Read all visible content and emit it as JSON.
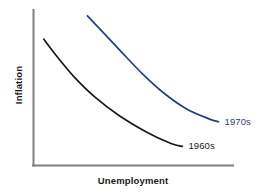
{
  "chart_data": {
    "type": "line",
    "title": "",
    "subtitle": "",
    "xlabel": "Unemployment",
    "ylabel": "Inflation",
    "grid": false,
    "legend_position": "inline-end-of-curve",
    "axis_style": "open-L-spine-no-ticks",
    "xticks": [],
    "yticks": [],
    "xlim": [
      0,
      1
    ],
    "ylim": [
      0,
      1
    ],
    "annotations": [
      {
        "text": "1970s",
        "color": "#2a3f82",
        "attached_to": "1970s"
      },
      {
        "text": "1960s",
        "color": "#1a1a1a",
        "attached_to": "1960s"
      }
    ],
    "series": [
      {
        "name": "1960s",
        "label": "1960s",
        "color": "#1a1a1a",
        "x": [
          0.03,
          0.1,
          0.19,
          0.3,
          0.43,
          0.57,
          0.7,
          0.76
        ],
        "y": [
          0.82,
          0.7,
          0.56,
          0.42,
          0.29,
          0.18,
          0.1,
          0.08
        ]
      },
      {
        "name": "1970s",
        "label": "1970s",
        "color": "#2a3f82",
        "x": [
          0.26,
          0.34,
          0.44,
          0.55,
          0.66,
          0.78,
          0.9,
          0.95
        ],
        "y": [
          0.98,
          0.87,
          0.73,
          0.58,
          0.45,
          0.34,
          0.27,
          0.25
        ]
      }
    ]
  },
  "colors": {
    "background": "#ffffff",
    "axis": "#7f7f7f",
    "series_1960s": "#1a1a1a",
    "series_1970s": "#2a3f82",
    "text": "#1a1a1a"
  }
}
